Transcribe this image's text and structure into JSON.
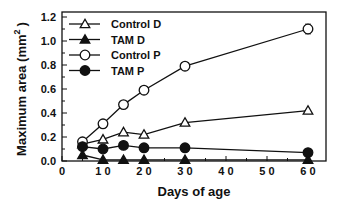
{
  "chart_data": {
    "type": "line",
    "title": "",
    "xlabel": "Days of age",
    "ylabel": "Maximum area (mm²)",
    "ylabel_base": "Maximum area (mm",
    "ylabel_sup": "2",
    "ylabel_close": ")",
    "xlim": [
      0,
      65
    ],
    "ylim": [
      0,
      1.2
    ],
    "xticks": [
      0,
      10,
      20,
      30,
      40,
      50,
      60
    ],
    "xtick_labels": [
      "0",
      "1 0",
      "2 0",
      "3 0",
      "4 0",
      "5 0",
      "6 0"
    ],
    "yticks": [
      0.0,
      0.2,
      0.4,
      0.6,
      0.8,
      1.0,
      1.2
    ],
    "ytick_labels": [
      "0.0",
      "0.2",
      "0.4",
      "0.6",
      "0.8",
      "1.0",
      "1.2"
    ],
    "grid": false,
    "legend_position": "top-left",
    "x": [
      5,
      10,
      15,
      20,
      30,
      60
    ],
    "series": [
      {
        "name": "Control D",
        "marker": "open-triangle",
        "values": [
          0.14,
          0.18,
          0.24,
          0.22,
          0.32,
          0.42
        ],
        "error_bars": [
          null,
          null,
          null,
          null,
          null,
          null
        ]
      },
      {
        "name": "TAM D",
        "marker": "filled-triangle",
        "values": [
          0.05,
          0.01,
          0.01,
          0.01,
          0.01,
          0.01
        ],
        "error_bars": [
          null,
          null,
          null,
          null,
          null,
          null
        ]
      },
      {
        "name": "Control P",
        "marker": "open-circle",
        "values": [
          0.16,
          0.31,
          0.47,
          0.59,
          0.79,
          1.1
        ],
        "error_bars": [
          null,
          null,
          null,
          null,
          null,
          0.04
        ]
      },
      {
        "name": "TAM P",
        "marker": "filled-circle",
        "values": [
          0.12,
          0.1,
          0.13,
          0.11,
          0.11,
          0.07
        ],
        "error_bars": [
          null,
          null,
          null,
          null,
          null,
          null
        ]
      }
    ]
  }
}
